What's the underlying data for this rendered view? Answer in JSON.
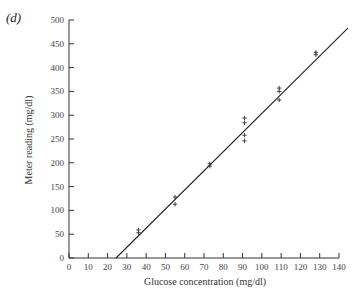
{
  "panel_label": "(d)",
  "chart_data": {
    "type": "scatter",
    "title": "",
    "xlabel": "Glucose concentration (mg/dl)",
    "ylabel": "Meter reading (mg/dl)",
    "xlim": [
      0,
      140
    ],
    "ylim": [
      0,
      500
    ],
    "xticks": [
      0,
      10,
      20,
      30,
      40,
      50,
      60,
      70,
      80,
      90,
      100,
      110,
      120,
      130,
      140
    ],
    "yticks": [
      0,
      50,
      100,
      150,
      200,
      250,
      300,
      350,
      400,
      450,
      500
    ],
    "grid": false,
    "legend": null,
    "marker": "+",
    "series": [
      {
        "name": "measurements",
        "points": [
          {
            "x": 36,
            "y": 59
          },
          {
            "x": 36,
            "y": 53
          },
          {
            "x": 55,
            "y": 128
          },
          {
            "x": 55,
            "y": 113
          },
          {
            "x": 73,
            "y": 198
          },
          {
            "x": 73,
            "y": 193
          },
          {
            "x": 91,
            "y": 294
          },
          {
            "x": 91,
            "y": 284
          },
          {
            "x": 91,
            "y": 258
          },
          {
            "x": 91,
            "y": 246
          },
          {
            "x": 109,
            "y": 357
          },
          {
            "x": 109,
            "y": 350
          },
          {
            "x": 109,
            "y": 332
          },
          {
            "x": 128,
            "y": 432
          },
          {
            "x": 128,
            "y": 427
          }
        ]
      },
      {
        "name": "regression line",
        "type": "line",
        "points": [
          {
            "x": 24.4,
            "y": 0
          },
          {
            "x": 144.6,
            "y": 483
          }
        ]
      }
    ]
  }
}
